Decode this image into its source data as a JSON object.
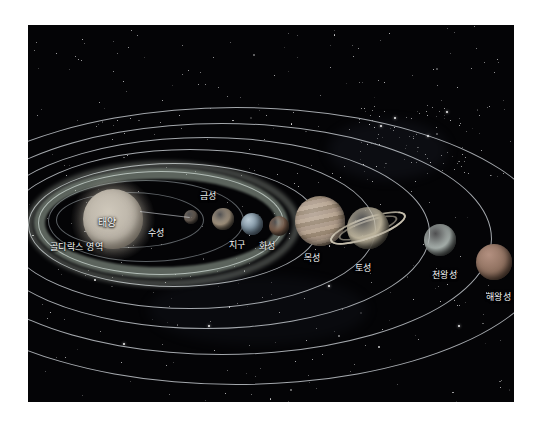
{
  "scene": {
    "title": "태양계",
    "background_color": "#040406",
    "page_border_color": "#ffffff",
    "orbit_color": "#e1e6eb",
    "habitable_zone_color": "#c4d6c4"
  },
  "habitable_zone": {
    "label": "골디락스 영역",
    "label_x": 22,
    "label_y": 215
  },
  "bodies": [
    {
      "name": "sun",
      "label": "태양",
      "cx": 85,
      "cy": 194,
      "r": 30,
      "color": "#b9b2a6",
      "label_x": 70,
      "label_y": 189,
      "label_inside": true
    },
    {
      "name": "mercury",
      "label": "수성",
      "cx": 163,
      "cy": 192,
      "r": 7,
      "color": "#8e8073",
      "label_x": 120,
      "label_y": 201,
      "label_inside": false
    },
    {
      "name": "venus",
      "label": "금성",
      "cx": 195,
      "cy": 194,
      "r": 11,
      "color": "#b6a58e",
      "label_x": 172,
      "label_y": 164,
      "label_inside": false
    },
    {
      "name": "earth",
      "label": "지구",
      "cx": 224,
      "cy": 199,
      "r": 11,
      "color": "#8fa2ae",
      "label_x": 201,
      "label_y": 213,
      "label_inside": false
    },
    {
      "name": "mars",
      "label": "화성",
      "cx": 251,
      "cy": 201,
      "r": 10,
      "color": "#8a6a55",
      "label_x": 231,
      "label_y": 214,
      "label_inside": false
    },
    {
      "name": "jupiter",
      "label": "목성",
      "cx": 292,
      "cy": 196,
      "r": 25,
      "color": "#a89584",
      "label_x": 276,
      "label_y": 226,
      "label_inside": false
    },
    {
      "name": "saturn",
      "label": "토성",
      "cx": 340,
      "cy": 203,
      "r": 21,
      "color": "#bcb39c",
      "label_x": 327,
      "label_y": 236,
      "label_inside": false
    },
    {
      "name": "uranus",
      "label": "천왕성",
      "cx": 412,
      "cy": 215,
      "r": 16,
      "color": "#a9b2ae",
      "label_x": 404,
      "label_y": 243,
      "label_inside": false
    },
    {
      "name": "neptune",
      "label": "해왕성",
      "cx": 466,
      "cy": 237,
      "r": 18,
      "color": "#8d6f5e",
      "label_x": 458,
      "label_y": 265,
      "label_inside": false
    }
  ],
  "orbits": [
    {
      "name": "mercury-orbit",
      "left": 28,
      "top": 167,
      "width": 148,
      "height": 56,
      "style": "dim"
    },
    {
      "name": "venus-orbit",
      "left": 20,
      "top": 155,
      "width": 196,
      "height": 82,
      "style": "dim"
    },
    {
      "name": "earth-orbit",
      "left": 10,
      "top": 146,
      "width": 246,
      "height": 104,
      "style": "solid"
    },
    {
      "name": "mars-orbit",
      "left": 0,
      "top": 138,
      "width": 292,
      "height": 124,
      "style": "solid"
    },
    {
      "name": "jupiter-orbit",
      "left": -24,
      "top": 124,
      "width": 372,
      "height": 160,
      "style": "solid"
    },
    {
      "name": "saturn-orbit",
      "left": -46,
      "top": 112,
      "width": 448,
      "height": 192,
      "style": "solid"
    },
    {
      "name": "uranus-orbit",
      "left": -76,
      "top": 98,
      "width": 540,
      "height": 232,
      "style": "solid"
    },
    {
      "name": "neptune-orbit",
      "left": -110,
      "top": 82,
      "width": 636,
      "height": 278,
      "style": "solid"
    }
  ],
  "stars": {
    "count_description": "scattered white points across black sky"
  }
}
